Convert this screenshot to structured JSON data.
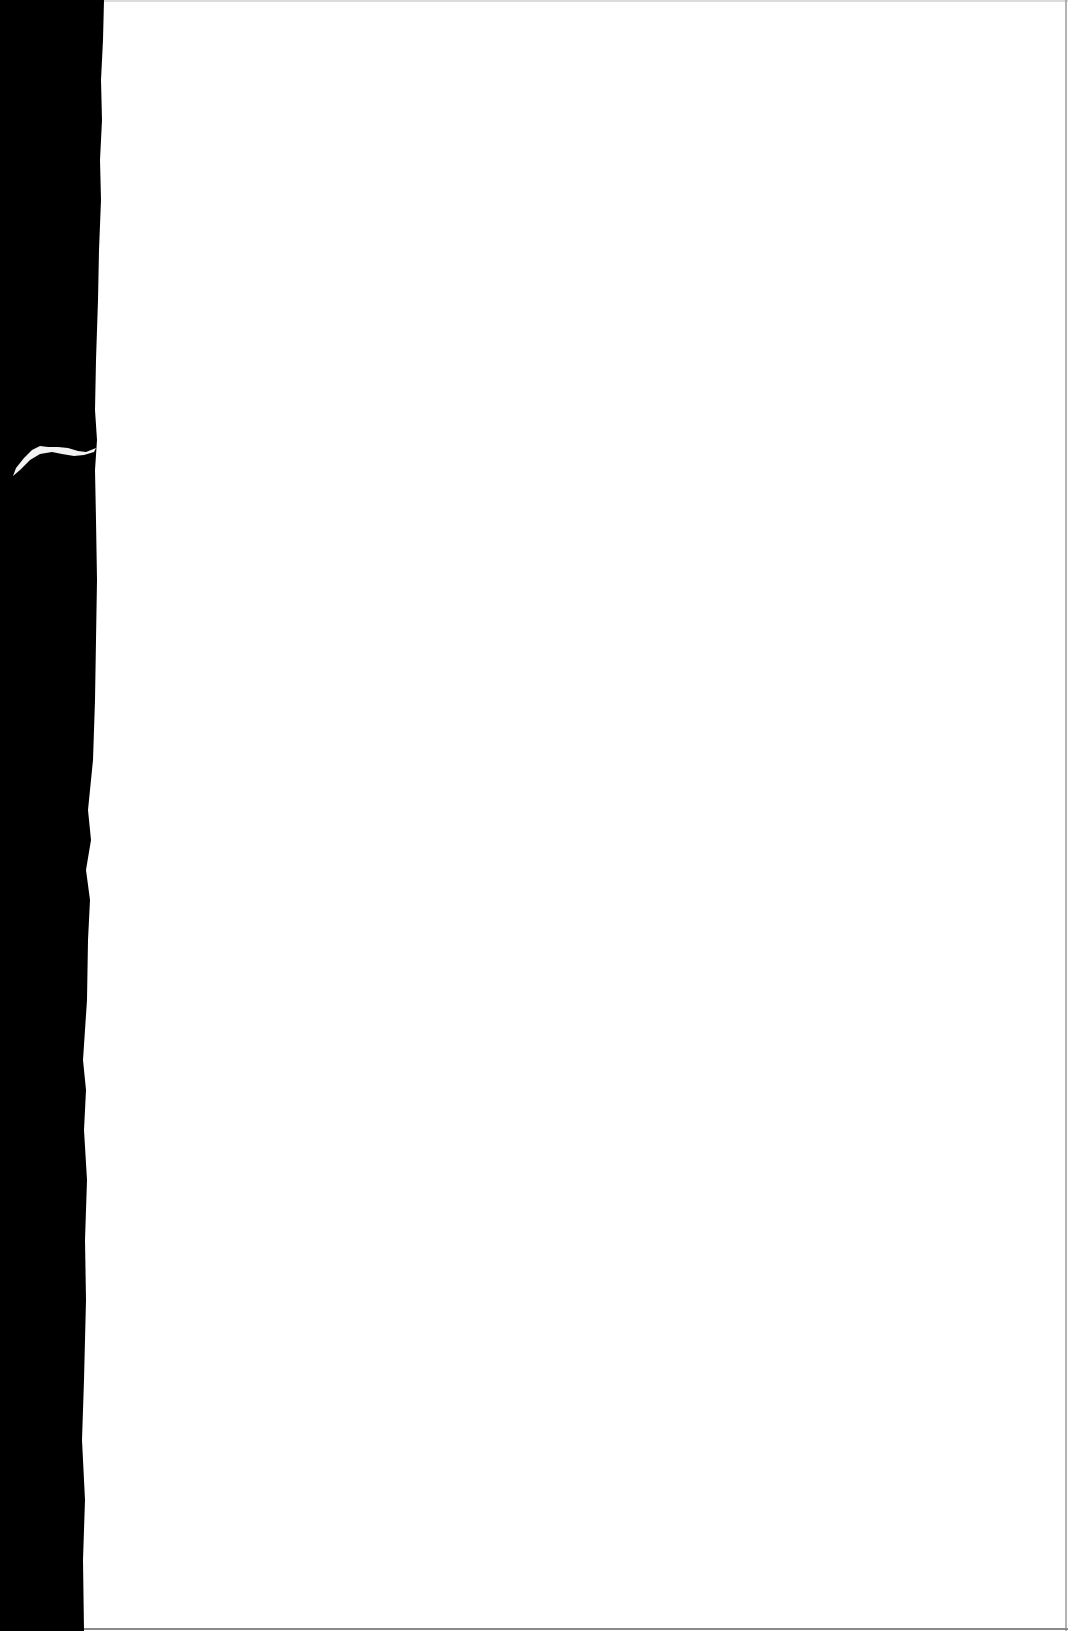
{
  "document": {
    "type": "scanned-blank-page",
    "text": "",
    "colors": {
      "background": "#000000",
      "paper": "#ffffff",
      "paper_edge": "#e8e8e8",
      "border_line": "#9a9a9a"
    }
  }
}
